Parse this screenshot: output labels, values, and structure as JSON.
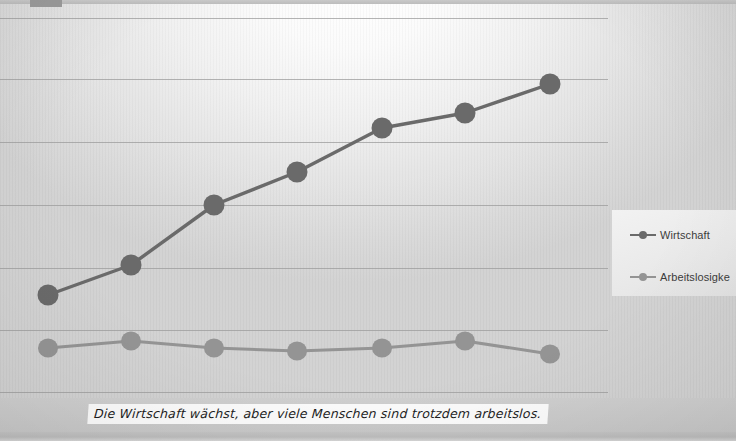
{
  "slide": {
    "background_color": "#d9d9d9",
    "corner_tab_color": "#9a9a9a"
  },
  "legend": {
    "position": "right",
    "entries": [
      {
        "label": "Wirtschaft",
        "color": "#6a6a6a"
      },
      {
        "label": "Arbeitslosigke",
        "color": "#949494"
      }
    ]
  },
  "caption": {
    "text": "Die Wirtschaft wächst, aber viele Menschen sind trotzdem arbeitslos."
  },
  "chart_data": {
    "type": "line",
    "title": "",
    "subtitle": "",
    "xlabel": "",
    "ylabel": "",
    "xlim": [
      0,
      6
    ],
    "ylim": [
      0,
      100
    ],
    "grid": true,
    "grid_axis": "y",
    "gridline_count": 7,
    "legend_position": "right",
    "tick_labels_visible": false,
    "axis_labels_visible": false,
    "categories": [
      "1",
      "2",
      "3",
      "4",
      "5",
      "6",
      "7"
    ],
    "series": [
      {
        "name": "Wirtschaft",
        "color": "#6a6a6a",
        "marker": "circle",
        "values": [
          27,
          35,
          50,
          58,
          69,
          73,
          80
        ],
        "points_px": [
          {
            "x": 48,
            "y": 295
          },
          {
            "x": 131,
            "y": 265
          },
          {
            "x": 214,
            "y": 205
          },
          {
            "x": 297,
            "y": 172
          },
          {
            "x": 382,
            "y": 128
          },
          {
            "x": 465,
            "y": 113
          },
          {
            "x": 550,
            "y": 84
          }
        ]
      },
      {
        "name": "Arbeitslosigkeit",
        "color": "#949494",
        "marker": "circle",
        "values": [
          13,
          15,
          13,
          12,
          13,
          15,
          11.5
        ],
        "points_px": [
          {
            "x": 48,
            "y": 348
          },
          {
            "x": 131,
            "y": 341
          },
          {
            "x": 214,
            "y": 348
          },
          {
            "x": 297,
            "y": 351
          },
          {
            "x": 382,
            "y": 348
          },
          {
            "x": 465,
            "y": 341
          },
          {
            "x": 550,
            "y": 354
          }
        ]
      }
    ],
    "gridlines_px_y": [
      18,
      79,
      142,
      205,
      268,
      330,
      392
    ]
  }
}
